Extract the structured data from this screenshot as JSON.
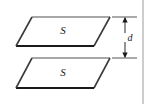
{
  "figure": {
    "type": "parallel-plate-capacitor-diagram",
    "background_color": "#ffffff",
    "stroke_color": "#333333",
    "thick_edge_color": "#1a1a1a",
    "light_edge_color": "#888888",
    "border_line_color": "#9a9a9a",
    "top_plate": {
      "label": "S",
      "label_x": 63,
      "label_y": 34,
      "points": "32,17 110,17 94,46 16,46"
    },
    "bottom_plate": {
      "label": "S",
      "label_x": 63,
      "label_y": 76,
      "points": "32,58 110,58 94,88 16,88"
    },
    "separation": {
      "label": "d",
      "label_x": 130,
      "label_y": 56,
      "arrow_x": 125,
      "top_y": 17,
      "bottom_y": 58,
      "extension_top_y": 17,
      "extension_bottom_y": 58,
      "extension_x_start": 112,
      "extension_x_end": 137
    },
    "right_border": {
      "x": 143,
      "y_start": 0,
      "y_end": 104
    }
  }
}
